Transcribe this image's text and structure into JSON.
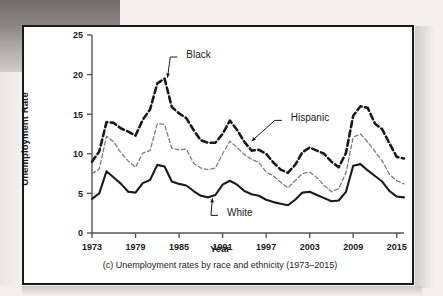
{
  "figure": {
    "caption": "(c) Unemployment rates by race and ethnicity (1973–2015)"
  },
  "chart_data": {
    "type": "line",
    "title": "",
    "xlabel": "Year",
    "ylabel": "Unemployment Rate",
    "xlim": [
      1973,
      2016
    ],
    "ylim": [
      0,
      25
    ],
    "yticks": [
      0,
      5,
      10,
      15,
      20,
      25
    ],
    "xticks": [
      1973,
      1979,
      1985,
      1991,
      1997,
      2003,
      2009,
      2015
    ],
    "grid": false,
    "legend": "inline-annotations",
    "annotations": [
      {
        "label": "Black",
        "x": 1986.0,
        "y": 22.6,
        "points_to_x": 1983.4,
        "points_to_y": 19.6
      },
      {
        "label": "Hispanic",
        "x": 2000.4,
        "y": 14.6,
        "points_to_x": 1995.0,
        "points_to_y": 11.6
      },
      {
        "label": "White",
        "x": 1991.6,
        "y": 2.6,
        "points_to_x": 1989.6,
        "points_to_y": 4.4
      }
    ],
    "x": [
      1973,
      1974,
      1975,
      1976,
      1977,
      1978,
      1979,
      1980,
      1981,
      1982,
      1983,
      1984,
      1985,
      1986,
      1987,
      1988,
      1989,
      1990,
      1991,
      1992,
      1993,
      1994,
      1995,
      1996,
      1997,
      1998,
      1999,
      2000,
      2001,
      2002,
      2003,
      2004,
      2005,
      2006,
      2007,
      2008,
      2009,
      2010,
      2011,
      2012,
      2013,
      2014,
      2015,
      2016
    ],
    "series": [
      {
        "name": "Black",
        "style": "bold-dashed",
        "color": "#1a1a1a",
        "values": [
          9.0,
          10.3,
          14.0,
          13.9,
          13.2,
          12.8,
          12.3,
          14.3,
          15.6,
          18.9,
          19.5,
          15.9,
          15.1,
          14.5,
          13.0,
          11.7,
          11.4,
          11.4,
          12.5,
          14.2,
          13.0,
          11.5,
          10.4,
          10.5,
          10.0,
          8.9,
          8.0,
          7.6,
          8.6,
          10.2,
          10.8,
          10.4,
          10.0,
          9.0,
          8.3,
          10.1,
          14.8,
          16.0,
          15.8,
          13.8,
          13.1,
          11.3,
          9.6,
          9.4
        ]
      },
      {
        "name": "Hispanic",
        "style": "light-dashed",
        "color": "#7d7d7a",
        "values": [
          7.5,
          8.1,
          12.2,
          11.5,
          10.1,
          9.1,
          8.3,
          10.1,
          10.4,
          13.8,
          13.7,
          10.7,
          10.5,
          10.6,
          8.8,
          8.2,
          8.0,
          8.2,
          10.0,
          11.6,
          10.8,
          9.9,
          9.3,
          8.9,
          7.7,
          7.2,
          6.4,
          5.7,
          6.6,
          7.5,
          7.7,
          7.0,
          6.0,
          5.2,
          5.6,
          7.6,
          12.1,
          12.5,
          11.5,
          10.3,
          9.1,
          7.4,
          6.6,
          6.2
        ]
      },
      {
        "name": "White",
        "style": "solid",
        "color": "#1a1a1a",
        "values": [
          4.3,
          5.0,
          7.8,
          7.0,
          6.2,
          5.2,
          5.1,
          6.3,
          6.7,
          8.6,
          8.4,
          6.5,
          6.2,
          6.0,
          5.3,
          4.7,
          4.5,
          4.8,
          6.1,
          6.6,
          6.1,
          5.3,
          4.9,
          4.7,
          4.2,
          3.9,
          3.7,
          3.5,
          4.2,
          5.1,
          5.2,
          4.8,
          4.4,
          4.0,
          4.1,
          5.2,
          8.5,
          8.7,
          7.9,
          7.2,
          6.5,
          5.3,
          4.6,
          4.5
        ]
      }
    ]
  }
}
